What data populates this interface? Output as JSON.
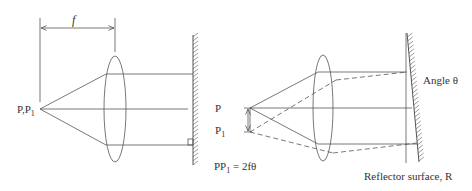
{
  "left_diagram": {
    "focal_label": "f",
    "point_label": "P,P",
    "point_sub": "1"
  },
  "right_diagram": {
    "label_p": "P",
    "label_p1": "P",
    "label_p1_sub": "1",
    "equation_pre": "PP",
    "equation_sub": "1",
    "equation_post": " = 2fθ",
    "angle_label": "Angle θ",
    "reflector_label": "Reflector surface, R"
  },
  "colors": {
    "line": "#555555",
    "text": "#333333"
  }
}
